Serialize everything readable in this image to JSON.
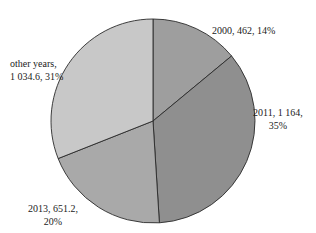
{
  "chart_data": {
    "type": "pie",
    "title": "",
    "start_angle_deg": 0,
    "direction": "clockwise",
    "slices": [
      {
        "label": "2000",
        "value": 462,
        "percent": 14,
        "color": "#9e9e9e",
        "text_line1": "2000, 462, 14%",
        "text_line2": ""
      },
      {
        "label": "2011",
        "value": 1164,
        "percent": 35,
        "color": "#8f8f8f",
        "text_line1": "2011, 1 164,",
        "text_line2": "35%"
      },
      {
        "label": "2013",
        "value": 651.2,
        "percent": 20,
        "color": "#a9a9a9",
        "text_line1": "2013, 651.2,",
        "text_line2": "20%"
      },
      {
        "label": "other years",
        "value": 1034.6,
        "percent": 31,
        "color": "#c8c8c8",
        "text_line1": "other years,",
        "text_line2": "1 034.6, 31%"
      }
    ]
  }
}
